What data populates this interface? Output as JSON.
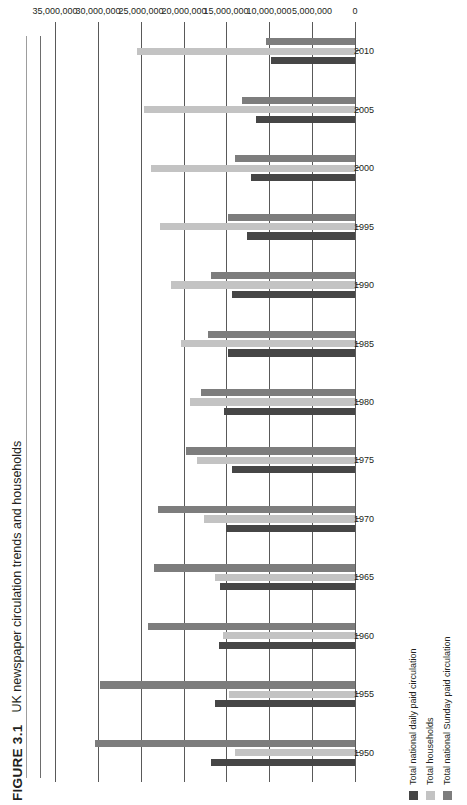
{
  "figure": {
    "number": "FIGURE 3.1",
    "title": "UK newspaper circulation trends and households"
  },
  "legend": {
    "position": "bottom-left",
    "items": [
      {
        "label": "Total national daily paid circulation",
        "color": "#464646"
      },
      {
        "label": "Total households",
        "color": "#c3c3c3"
      },
      {
        "label": "Total national Sunday paid circulation",
        "color": "#7d7d7d"
      }
    ]
  },
  "chart_data": {
    "type": "bar",
    "orientation": "horizontal",
    "title": "UK newspaper circulation trends and households",
    "xlabel": "",
    "ylabel": "",
    "grid": true,
    "value_axis": {
      "min": 0,
      "max": 35000000,
      "tick_step": 5000000,
      "tick_labels": [
        "0",
        "5,000,000",
        "10,000,000",
        "15,000,000",
        "20,000,000",
        "25,000,000",
        "30,000,000",
        "35,000,000"
      ],
      "tick_values": [
        0,
        5000000,
        10000000,
        15000000,
        20000000,
        25000000,
        30000000,
        35000000
      ]
    },
    "categories": [
      "1950",
      "1955",
      "1960",
      "1965",
      "1970",
      "1975",
      "1980",
      "1985",
      "1990",
      "1995",
      "2000",
      "2005",
      "2010"
    ],
    "series": [
      {
        "name": "Total national daily paid circulation",
        "color": "#464646",
        "values": [
          16800000,
          16300000,
          15900000,
          15700000,
          15100000,
          14300000,
          15300000,
          14800000,
          14400000,
          12600000,
          12100000,
          11600000,
          9800000
        ]
      },
      {
        "name": "Total households",
        "color": "#c3c3c3",
        "values": [
          14000000,
          14700000,
          15400000,
          16300000,
          17600000,
          18400000,
          19300000,
          20300000,
          21500000,
          22800000,
          23800000,
          24600000,
          25400000
        ]
      },
      {
        "name": "Total national Sunday paid circulation",
        "color": "#7d7d7d",
        "values": [
          30300000,
          29800000,
          24200000,
          23400000,
          23000000,
          19700000,
          18000000,
          17100000,
          16800000,
          14800000,
          14000000,
          13200000,
          10400000
        ]
      }
    ]
  }
}
